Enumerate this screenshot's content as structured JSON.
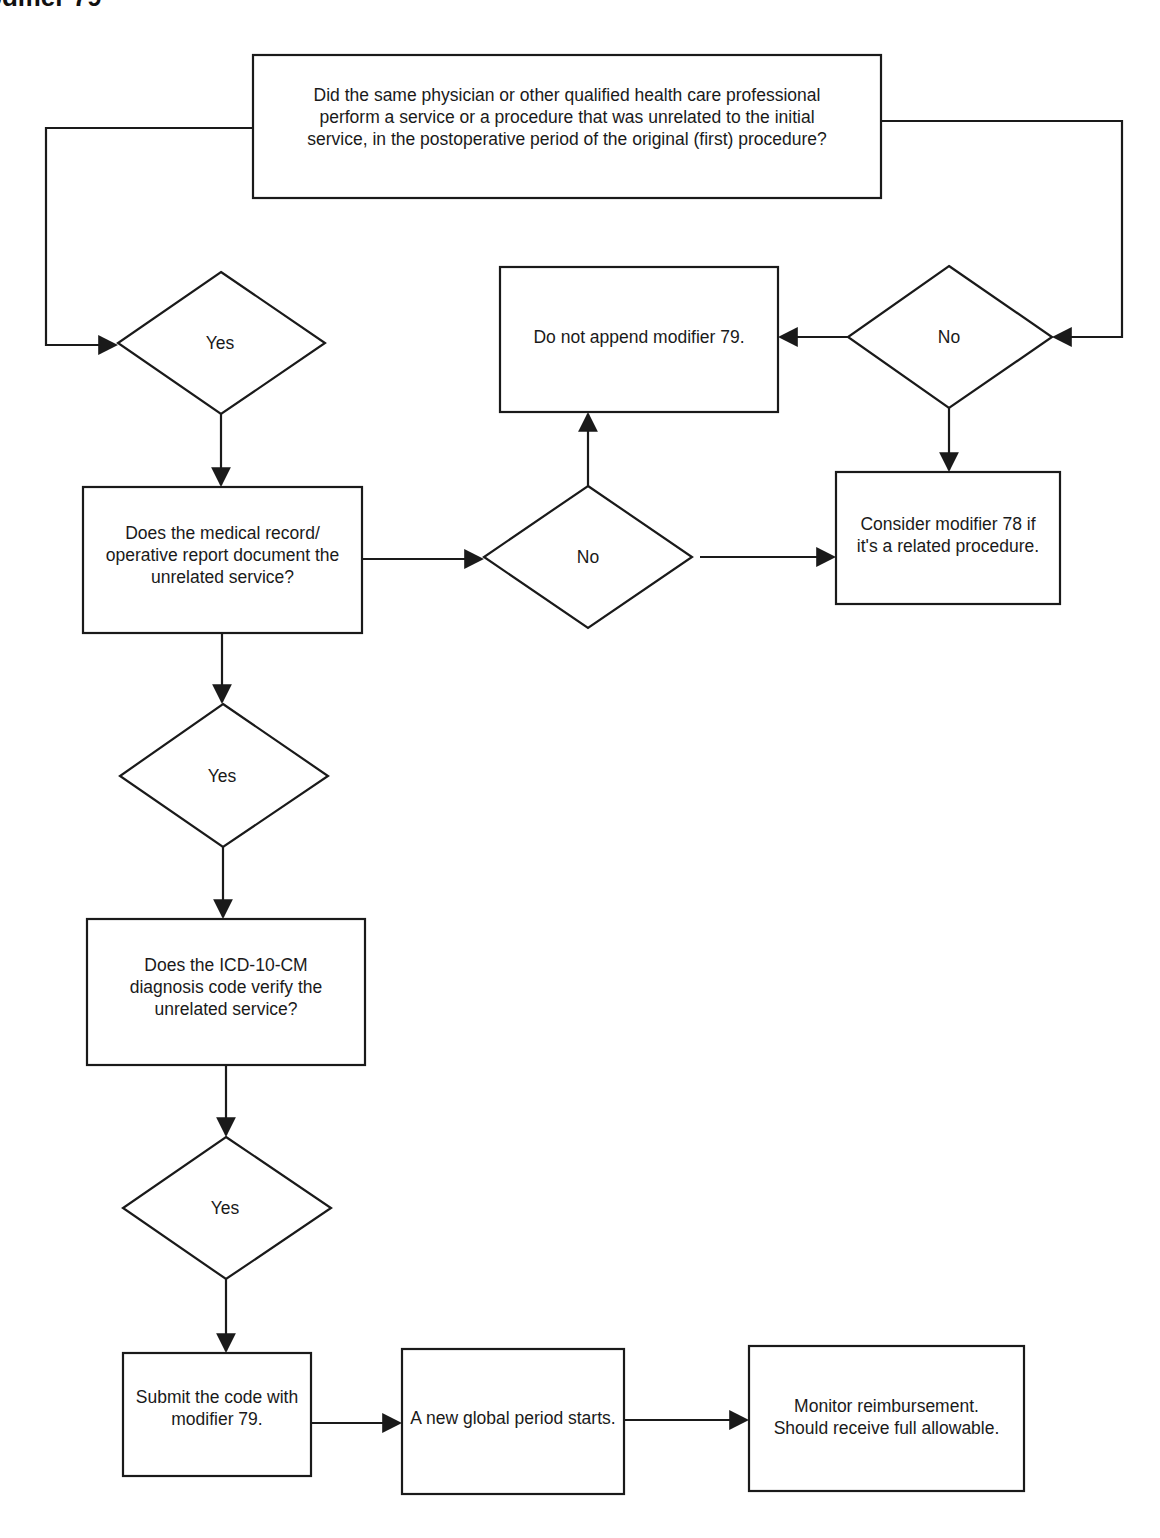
{
  "page": {
    "title": "odifier 79"
  },
  "nodes": {
    "start_question": {
      "lines": [
        "Did the same physician or other qualified health care professional",
        "perform a service or a procedure that was unrelated to the initial",
        "service, in the postoperative period of the original (first) procedure?"
      ]
    },
    "decision_yes_1": {
      "label": "Yes"
    },
    "decision_no_1": {
      "label": "No"
    },
    "do_not_append": {
      "lines": [
        "Do not append modifier 79."
      ]
    },
    "record_question": {
      "lines": [
        "Does the medical record/",
        "operative report document the",
        "unrelated service?"
      ]
    },
    "decision_no_2": {
      "label": "No"
    },
    "consider_78": {
      "lines": [
        "Consider modifier 78 if",
        "it's a related procedure."
      ]
    },
    "decision_yes_2": {
      "label": "Yes"
    },
    "icd_question": {
      "lines": [
        "Does the ICD-10-CM",
        "diagnosis code verify the",
        "unrelated service?"
      ]
    },
    "decision_yes_3": {
      "label": "Yes"
    },
    "submit_code": {
      "lines": [
        "Submit the code with",
        "modifier 79."
      ]
    },
    "new_global_period": {
      "lines": [
        "A new global period starts."
      ]
    },
    "monitor": {
      "lines": [
        "Monitor reimbursement.",
        "Should receive full allowable."
      ]
    }
  },
  "edges": [
    {
      "from": "start_question",
      "to": "decision_yes_1"
    },
    {
      "from": "start_question",
      "to": "decision_no_1"
    },
    {
      "from": "decision_no_1",
      "to": "do_not_append"
    },
    {
      "from": "decision_no_1",
      "to": "consider_78"
    },
    {
      "from": "decision_yes_1",
      "to": "record_question"
    },
    {
      "from": "record_question",
      "to": "decision_no_2"
    },
    {
      "from": "decision_no_2",
      "to": "do_not_append"
    },
    {
      "from": "decision_no_2",
      "to": "consider_78"
    },
    {
      "from": "record_question",
      "to": "decision_yes_2"
    },
    {
      "from": "decision_yes_2",
      "to": "icd_question"
    },
    {
      "from": "icd_question",
      "to": "decision_yes_3"
    },
    {
      "from": "decision_yes_3",
      "to": "submit_code"
    },
    {
      "from": "submit_code",
      "to": "new_global_period"
    },
    {
      "from": "new_global_period",
      "to": "monitor"
    }
  ],
  "colors": {
    "stroke": "#1a1a1a",
    "background": "#ffffff",
    "text": "#1a1a1a"
  }
}
